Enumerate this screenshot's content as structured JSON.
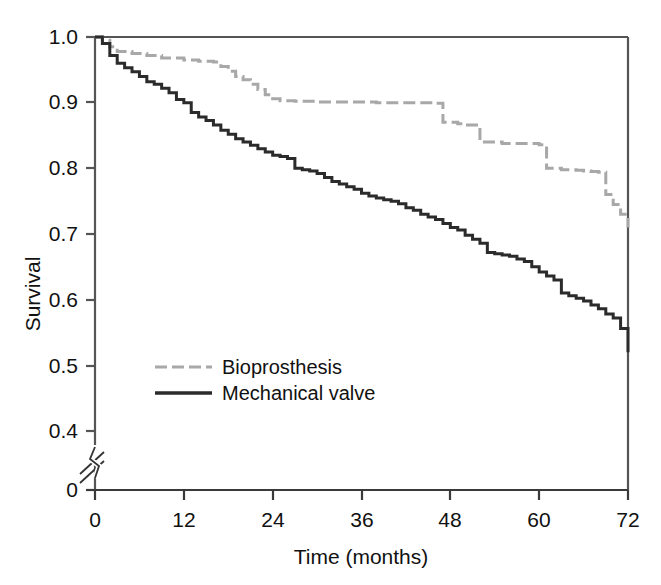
{
  "chart_data": {
    "type": "line",
    "title": "",
    "xlabel": "Time (months)",
    "ylabel": "Survival",
    "xlim": [
      0,
      72
    ],
    "ylim": [
      0.4,
      1.0
    ],
    "y_axis_break": true,
    "y_break_label": "0",
    "grid": false,
    "legend_position": "inside-lower-left",
    "xticks": [
      0,
      12,
      24,
      36,
      48,
      60,
      72
    ],
    "xtick_labels": [
      "0",
      "12",
      "24",
      "36",
      "48",
      "60",
      "72"
    ],
    "yticks": [
      0.4,
      0.5,
      0.6,
      0.7,
      0.8,
      0.9,
      1.0
    ],
    "ytick_labels": [
      "0.4",
      "0.5",
      "0.6",
      "0.7",
      "0.8",
      "0.9",
      "1.0"
    ],
    "series": [
      {
        "name": "Bioprosthesis",
        "style": "dashed",
        "color": "#a8a8a8",
        "linewidth": 3,
        "step": "post",
        "x": [
          0,
          1,
          2,
          3,
          5,
          7,
          9,
          12,
          14,
          16,
          17,
          18,
          19,
          20,
          21,
          22,
          23,
          24,
          25,
          27,
          30,
          34,
          38,
          42,
          45,
          46,
          47,
          49,
          50,
          52,
          55,
          58,
          60,
          61,
          63,
          65,
          66,
          67,
          68,
          69,
          70,
          71,
          72
        ],
        "y": [
          1.0,
          0.995,
          0.985,
          0.978,
          0.975,
          0.972,
          0.968,
          0.965,
          0.963,
          0.962,
          0.955,
          0.948,
          0.94,
          0.935,
          0.928,
          0.92,
          0.912,
          0.906,
          0.903,
          0.902,
          0.901,
          0.901,
          0.9,
          0.9,
          0.9,
          0.899,
          0.87,
          0.868,
          0.866,
          0.84,
          0.838,
          0.838,
          0.836,
          0.8,
          0.798,
          0.797,
          0.796,
          0.795,
          0.794,
          0.76,
          0.745,
          0.73,
          0.71
        ]
      },
      {
        "name": "Mechanical valve",
        "style": "solid",
        "color": "#2b2b2b",
        "linewidth": 3,
        "step": "post",
        "x": [
          0,
          1,
          2,
          3,
          4,
          5,
          6,
          7,
          8,
          9,
          10,
          11,
          12,
          13,
          14,
          15,
          16,
          17,
          18,
          19,
          20,
          21,
          22,
          23,
          24,
          25,
          26,
          27,
          28,
          29,
          30,
          31,
          32,
          33,
          34,
          35,
          36,
          37,
          38,
          39,
          40,
          41,
          42,
          43,
          44,
          45,
          46,
          47,
          48,
          49,
          50,
          51,
          52,
          53,
          54,
          55,
          56,
          57,
          58,
          59,
          60,
          61,
          62,
          63,
          64,
          65,
          66,
          67,
          68,
          69,
          70,
          71,
          72
        ],
        "y": [
          1.0,
          0.99,
          0.972,
          0.96,
          0.953,
          0.947,
          0.94,
          0.932,
          0.928,
          0.922,
          0.915,
          0.905,
          0.9,
          0.885,
          0.878,
          0.873,
          0.866,
          0.858,
          0.852,
          0.845,
          0.84,
          0.835,
          0.83,
          0.825,
          0.82,
          0.818,
          0.815,
          0.8,
          0.798,
          0.796,
          0.792,
          0.786,
          0.78,
          0.776,
          0.772,
          0.768,
          0.762,
          0.758,
          0.755,
          0.752,
          0.75,
          0.746,
          0.74,
          0.736,
          0.73,
          0.726,
          0.722,
          0.716,
          0.71,
          0.706,
          0.698,
          0.692,
          0.686,
          0.672,
          0.67,
          0.668,
          0.666,
          0.662,
          0.658,
          0.65,
          0.642,
          0.636,
          0.63,
          0.61,
          0.606,
          0.602,
          0.598,
          0.592,
          0.586,
          0.578,
          0.572,
          0.556,
          0.52
        ]
      }
    ]
  },
  "legend": {
    "entries": [
      {
        "label": "Bioprosthesis",
        "style": "dashed",
        "color": "#a8a8a8"
      },
      {
        "label": "Mechanical valve",
        "style": "solid",
        "color": "#2b2b2b"
      }
    ]
  },
  "axes": {
    "x_title": "Time (months)",
    "y_title": "Survival",
    "x_labels": [
      "0",
      "12",
      "24",
      "36",
      "48",
      "60",
      "72"
    ],
    "y_labels": [
      "1.0",
      "0.9",
      "0.8",
      "0.7",
      "0.6",
      "0.5",
      "0.4"
    ],
    "y_zero_label": "0"
  }
}
